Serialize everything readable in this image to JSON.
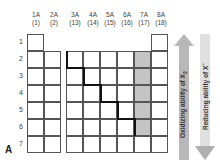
{
  "groups": [
    {
      "label": "1A",
      "number": "(1)"
    },
    {
      "label": "2A",
      "number": "(2)"
    },
    {
      "label": "3A",
      "number": "(13)"
    },
    {
      "label": "4A",
      "number": "(14)"
    },
    {
      "label": "5A",
      "number": "(15)"
    },
    {
      "label": "6A",
      "number": "(16)"
    },
    {
      "label": "7A",
      "number": "(17)"
    },
    {
      "label": "8A",
      "number": "(18)"
    }
  ],
  "periods": [
    "1",
    "2",
    "3",
    "4",
    "5",
    "6",
    "7"
  ],
  "shaded_group": "7A",
  "shaded_periods": [
    "2",
    "3",
    "4",
    "5",
    "6"
  ],
  "arrows": {
    "up": {
      "text_main": "Oxidizing ability of X",
      "sub": "2",
      "direction": "up"
    },
    "down": {
      "text_main": "Reducing ability of X",
      "sup": "−",
      "direction": "down"
    }
  },
  "panel_label": "A",
  "colors": {
    "shade": "#c4c4c4",
    "arrow": "#b8b8b8",
    "arrow_light": "#e4e4e4",
    "staircase": "#111111"
  }
}
